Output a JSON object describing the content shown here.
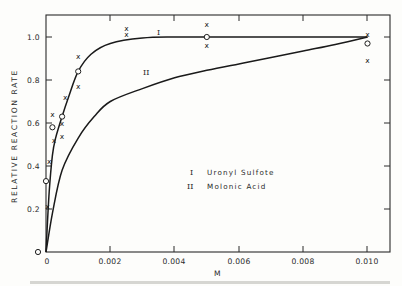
{
  "chart_data": {
    "type": "scatter",
    "title": "",
    "xlabel": "M",
    "ylabel": "RELATIVE REACTION RATE",
    "xlim": [
      0,
      0.0106
    ],
    "ylim": [
      0,
      1.1
    ],
    "grid": false,
    "legend_position": "center-right inside plot",
    "x_ticks": [
      {
        "value": 0,
        "label": "0"
      },
      {
        "value": 0.002,
        "label": "0.002"
      },
      {
        "value": 0.004,
        "label": "0.004"
      },
      {
        "value": 0.006,
        "label": "0.006"
      },
      {
        "value": 0.008,
        "label": "0.008"
      },
      {
        "value": 0.01,
        "label": "0.010"
      }
    ],
    "y_ticks": [
      {
        "value": 0,
        "label": "0"
      },
      {
        "value": 0.2,
        "label": "0.2"
      },
      {
        "value": 0.4,
        "label": "0.4"
      },
      {
        "value": 0.6,
        "label": "0.6"
      },
      {
        "value": 0.8,
        "label": "0.8"
      },
      {
        "value": 1.0,
        "label": "1.0"
      }
    ],
    "legend": [
      {
        "key": "I",
        "label": "Uranyl Sulfate"
      },
      {
        "key": "II",
        "label": "Malonic Acid"
      }
    ],
    "legend_display": [
      {
        "key": "I",
        "label": "Uronyl Sulfote"
      },
      {
        "key": "II",
        "label": "Molonic Acid"
      }
    ],
    "series": [
      {
        "name": "I",
        "label": "Uranyl Sulfate (fitted curve)",
        "kind": "curve",
        "x": [
          0,
          0.0001,
          0.0002,
          0.0003,
          0.0005,
          0.0007,
          0.001,
          0.0014,
          0.002,
          0.003,
          0.004,
          0.005,
          0.007,
          0.01
        ],
        "y": [
          0,
          0.28,
          0.45,
          0.53,
          0.63,
          0.72,
          0.84,
          0.92,
          0.97,
          0.995,
          1.0,
          1.0,
          1.0,
          1.0
        ]
      },
      {
        "name": "II",
        "label": "Malonic Acid (fitted curve)",
        "kind": "curve",
        "x": [
          0,
          0.0002,
          0.0005,
          0.001,
          0.0015,
          0.002,
          0.003,
          0.004,
          0.005,
          0.006,
          0.007,
          0.008,
          0.009,
          0.01
        ],
        "y": [
          0,
          0.18,
          0.38,
          0.53,
          0.63,
          0.7,
          0.76,
          0.81,
          0.845,
          0.875,
          0.905,
          0.935,
          0.965,
          1.0
        ]
      },
      {
        "name": "circles",
        "label": "open-circle data points",
        "kind": "markers",
        "marker": "o",
        "points": [
          {
            "x": 0,
            "y": 0.0
          },
          {
            "x": 0,
            "y": 0.33
          },
          {
            "x": 0.0002,
            "y": 0.58
          },
          {
            "x": 0.0005,
            "y": 0.63
          },
          {
            "x": 0.001,
            "y": 0.84
          },
          {
            "x": 0.005,
            "y": 1.0
          },
          {
            "x": 0.01,
            "y": 0.97
          }
        ]
      },
      {
        "name": "crosses",
        "label": "x data points",
        "kind": "markers",
        "marker": "x",
        "points": [
          {
            "x": 5e-05,
            "y": 0.21
          },
          {
            "x": 0.0001,
            "y": 0.42
          },
          {
            "x": 0.0002,
            "y": 0.64
          },
          {
            "x": 0.00025,
            "y": 0.52
          },
          {
            "x": 0.0005,
            "y": 0.6
          },
          {
            "x": 0.0005,
            "y": 0.54
          },
          {
            "x": 0.0006,
            "y": 0.72
          },
          {
            "x": 0.001,
            "y": 0.91
          },
          {
            "x": 0.001,
            "y": 0.77
          },
          {
            "x": 0.0025,
            "y": 1.04
          },
          {
            "x": 0.0025,
            "y": 1.01
          },
          {
            "x": 0.005,
            "y": 1.06
          },
          {
            "x": 0.005,
            "y": 0.96
          },
          {
            "x": 0.01,
            "y": 1.01
          },
          {
            "x": 0.01,
            "y": 0.89
          }
        ]
      }
    ],
    "annotations": [
      {
        "text": "I",
        "near": "curve I at x≈0.0035, y≈1.03"
      },
      {
        "text": "II",
        "near": "curve II at x≈0.0029, y≈0.82"
      }
    ]
  },
  "labels": {
    "x_axis_title": "M",
    "y_axis_title": "RELATIVE REACTION RATE",
    "curve_I_label": "I",
    "curve_II_label": "II",
    "legend_I_key": "I",
    "legend_I_text": "Uronyl Sulfote",
    "legend_II_key": "II",
    "legend_II_text": "Molonic Acid",
    "x_tick_0": "0",
    "x_tick_1": "0.002",
    "x_tick_2": "0.004",
    "x_tick_3": "0.006",
    "x_tick_4": "0.008",
    "x_tick_5": "0.010",
    "y_tick_0": "0",
    "y_tick_1": "0.2",
    "y_tick_2": "0.4",
    "y_tick_3": "0.6",
    "y_tick_4": "0.8",
    "y_tick_5": "1.0",
    "marker_x": "x"
  }
}
